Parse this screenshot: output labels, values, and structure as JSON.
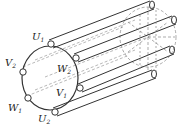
{
  "diagram": {
    "title": "",
    "stroke_color": "#333333",
    "dashed_color": "#777777",
    "labels": [
      {
        "id": "U1",
        "main": "U",
        "sub": "1",
        "x": 32,
        "y": 40
      },
      {
        "id": "V2",
        "main": "V",
        "sub": "2",
        "x": 5,
        "y": 66
      },
      {
        "id": "W2",
        "main": "W",
        "sub": "2",
        "x": 57,
        "y": 72
      },
      {
        "id": "V1",
        "main": "V",
        "sub": "1",
        "x": 56,
        "y": 96
      },
      {
        "id": "W1",
        "main": "W",
        "sub": "1",
        "x": 8,
        "y": 111
      },
      {
        "id": "U2",
        "main": "U",
        "sub": "2",
        "x": 38,
        "y": 122
      }
    ]
  }
}
